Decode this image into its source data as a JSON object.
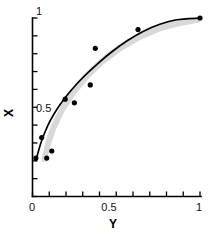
{
  "chart_data": {
    "type": "scatter",
    "title": "",
    "xlabel": "Y",
    "ylabel": "X",
    "xlim": [
      0,
      1
    ],
    "ylim": [
      0,
      1
    ],
    "grid": false,
    "legend": null,
    "x_tick_labels": [
      "0",
      "0.5",
      "1"
    ],
    "x_tick_values": [
      0,
      0.5,
      1
    ],
    "x_minor_tick_values": [
      0,
      0.1,
      0.2,
      0.3,
      0.4,
      0.5,
      0.6,
      0.7,
      0.8,
      0.9,
      1
    ],
    "y_tick_labels": [
      "0.5",
      "1"
    ],
    "y_tick_values": [
      0.5,
      1
    ],
    "y_minor_tick_values": [
      0,
      0.1,
      0.2,
      0.3,
      0.4,
      0.5,
      0.6,
      0.7,
      0.8,
      0.9,
      1
    ],
    "series": [
      {
        "name": "observations",
        "type": "scatter",
        "marker": "filled-circle",
        "color": "#000000",
        "points": [
          {
            "x": 0.02,
            "y": 0.215
          },
          {
            "x": 0.055,
            "y": 0.33
          },
          {
            "x": 0.085,
            "y": 0.215
          },
          {
            "x": 0.115,
            "y": 0.255
          },
          {
            "x": 0.195,
            "y": 0.545
          },
          {
            "x": 0.25,
            "y": 0.525
          },
          {
            "x": 0.345,
            "y": 0.625
          },
          {
            "x": 0.375,
            "y": 0.83
          },
          {
            "x": 0.63,
            "y": 0.935
          },
          {
            "x": 1.0,
            "y": 1.0
          }
        ]
      },
      {
        "name": "fitted-curve",
        "type": "line",
        "color": "#000000",
        "points": [
          {
            "x": 0.02,
            "y": 0.2
          },
          {
            "x": 0.05,
            "y": 0.3
          },
          {
            "x": 0.09,
            "y": 0.395
          },
          {
            "x": 0.13,
            "y": 0.465
          },
          {
            "x": 0.18,
            "y": 0.535
          },
          {
            "x": 0.24,
            "y": 0.605
          },
          {
            "x": 0.31,
            "y": 0.675
          },
          {
            "x": 0.39,
            "y": 0.745
          },
          {
            "x": 0.48,
            "y": 0.815
          },
          {
            "x": 0.57,
            "y": 0.875
          },
          {
            "x": 0.66,
            "y": 0.925
          },
          {
            "x": 0.76,
            "y": 0.965
          },
          {
            "x": 0.86,
            "y": 0.99
          },
          {
            "x": 1.0,
            "y": 1.0
          }
        ]
      }
    ],
    "band": {
      "name": "confidence-band",
      "color": "#d9d9d9",
      "upper": [
        {
          "x": 0.055,
          "y": 0.215
        },
        {
          "x": 0.09,
          "y": 0.345
        },
        {
          "x": 0.14,
          "y": 0.455
        },
        {
          "x": 0.2,
          "y": 0.555
        },
        {
          "x": 0.27,
          "y": 0.645
        },
        {
          "x": 0.35,
          "y": 0.725
        },
        {
          "x": 0.44,
          "y": 0.8
        },
        {
          "x": 0.54,
          "y": 0.865
        },
        {
          "x": 0.65,
          "y": 0.925
        },
        {
          "x": 0.78,
          "y": 0.975
        },
        {
          "x": 0.9,
          "y": 1.0
        },
        {
          "x": 1.0,
          "y": 1.0
        }
      ],
      "lower": [
        {
          "x": 1.0,
          "y": 0.975
        },
        {
          "x": 0.88,
          "y": 0.955
        },
        {
          "x": 0.76,
          "y": 0.925
        },
        {
          "x": 0.64,
          "y": 0.875
        },
        {
          "x": 0.53,
          "y": 0.815
        },
        {
          "x": 0.43,
          "y": 0.745
        },
        {
          "x": 0.34,
          "y": 0.665
        },
        {
          "x": 0.26,
          "y": 0.575
        },
        {
          "x": 0.19,
          "y": 0.475
        },
        {
          "x": 0.14,
          "y": 0.375
        },
        {
          "x": 0.105,
          "y": 0.275
        },
        {
          "x": 0.085,
          "y": 0.195
        },
        {
          "x": 0.055,
          "y": 0.195
        }
      ]
    }
  },
  "axes": {
    "y_title": "X",
    "x_title": "Y",
    "y_label_top": "1",
    "y_label_mid": "0.5",
    "x_label_left": "0",
    "x_label_mid": "0.5",
    "x_label_right": "1"
  }
}
